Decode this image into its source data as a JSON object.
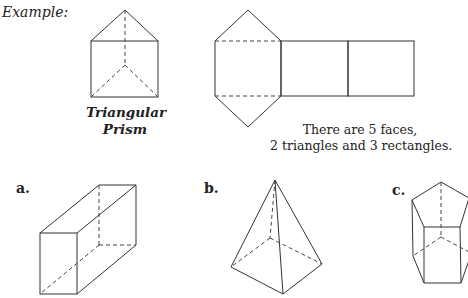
{
  "example": {
    "heading": "Example:",
    "shape_name_line1": "Triangular",
    "shape_name_line2": "Prism",
    "description_line1": "There are 5 faces,",
    "description_line2": "2 triangles and 3 rectangles."
  },
  "problems": [
    {
      "label": "a.",
      "shape": "rectangular-prism"
    },
    {
      "label": "b.",
      "shape": "square-pyramid"
    },
    {
      "label": "c.",
      "shape": "pentagonal-prism"
    }
  ]
}
